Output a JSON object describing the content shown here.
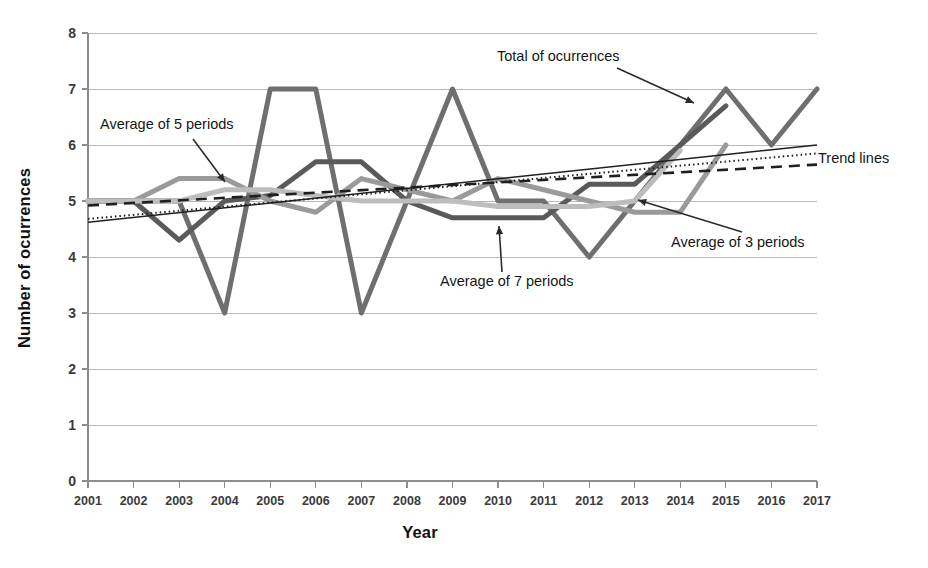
{
  "figure": {
    "background_color": "#ffffff",
    "plot_left_px": 88,
    "plot_right_px": 817,
    "plot_top_px": 33,
    "plot_bottom_px": 481
  },
  "chart_data": {
    "type": "line",
    "title": "",
    "xlabel": "Year",
    "ylabel": "Number of ocurrences",
    "xlim": [
      2001,
      2017
    ],
    "ylim": [
      0,
      8
    ],
    "ytick_step": 1,
    "grid": true,
    "grid_axis": "y",
    "legend": "none (inline annotations with leader lines)",
    "categories": [
      2001,
      2002,
      2003,
      2004,
      2005,
      2006,
      2007,
      2008,
      2009,
      2010,
      2011,
      2012,
      2013,
      2014,
      2015,
      2016,
      2017
    ],
    "xtick_labels": [
      "2001",
      "2002",
      "2003",
      "2004",
      "2005",
      "2006",
      "2007",
      "2008",
      "2009",
      "2010",
      "2011",
      "2012",
      "2013",
      "2014",
      "2015",
      "2016",
      "2017"
    ],
    "ytick_labels": [
      "0",
      "1",
      "2",
      "3",
      "4",
      "5",
      "6",
      "7",
      "8"
    ],
    "series": [
      {
        "name": "Total of ocurrences",
        "key": "total",
        "color": "#6f6f6f",
        "width": 5.0,
        "dash": "none",
        "x": [
          2001,
          2002,
          2003,
          2004,
          2005,
          2006,
          2007,
          2008,
          2009,
          2010,
          2011,
          2012,
          2013,
          2014,
          2015,
          2016,
          2017
        ],
        "values": [
          5,
          5,
          5,
          3,
          7,
          7,
          3,
          5,
          7,
          5,
          5,
          4,
          5,
          6,
          7,
          6,
          7
        ]
      },
      {
        "name": "Average of 3 periods",
        "key": "avg3",
        "color": "#5a5a5a",
        "width": 5.0,
        "dash": "none",
        "x": [
          2001,
          2002,
          2003,
          2004,
          2005,
          2006,
          2007,
          2008,
          2009,
          2010,
          2011,
          2012,
          2013,
          2014,
          2015
        ],
        "values": [
          5.0,
          5.0,
          4.3,
          5.0,
          5.1,
          5.7,
          5.7,
          5.0,
          4.7,
          4.7,
          4.7,
          5.3,
          5.3,
          6.0,
          6.7
        ]
      },
      {
        "name": "Average of 5 periods",
        "key": "avg5",
        "color": "#9a9a9a",
        "width": 5.0,
        "dash": "none",
        "x": [
          2001,
          2002,
          2003,
          2004,
          2005,
          2006,
          2007,
          2008,
          2009,
          2010,
          2011,
          2012,
          2013,
          2014,
          2015
        ],
        "values": [
          5.0,
          5.0,
          5.4,
          5.4,
          5.0,
          4.8,
          5.4,
          5.2,
          5.0,
          5.4,
          5.2,
          5.0,
          4.8,
          4.8,
          6.0
        ]
      },
      {
        "name": "Average of 7 periods",
        "key": "avg7",
        "color": "#bdbdbd",
        "width": 5.0,
        "dash": "none",
        "x": [
          2001,
          2002,
          2003,
          2004,
          2005,
          2006,
          2007,
          2008,
          2009,
          2010,
          2011,
          2012,
          2013,
          2014
        ],
        "values": [
          5.0,
          5.0,
          5.0,
          5.2,
          5.2,
          5.1,
          5.0,
          5.0,
          5.0,
          4.9,
          4.9,
          4.9,
          5.0,
          5.9
        ]
      }
    ],
    "trend_lines": [
      {
        "name": "Trend line - solid",
        "key": "trend_solid",
        "color": "#1f1f1f",
        "width": 1.5,
        "dash": "none",
        "x": [
          2001,
          2017
        ],
        "values": [
          4.62,
          6.0
        ]
      },
      {
        "name": "Trend line - dotted",
        "key": "trend_dotted",
        "color": "#1f1f1f",
        "width": 2.0,
        "dash": "1.5 3",
        "x": [
          2001,
          2017
        ],
        "values": [
          4.68,
          5.85
        ]
      },
      {
        "name": "Trend line - dashed",
        "key": "trend_dashed",
        "color": "#1f1f1f",
        "width": 2.6,
        "dash": "11 7",
        "x": [
          2001,
          2017
        ],
        "values": [
          4.92,
          5.65
        ]
      }
    ],
    "annotations": [
      {
        "key": "total",
        "label": "Total of ocurrences",
        "text_x_px": 497,
        "text_y_px": 61,
        "leader": [
          [
            617,
            68
          ],
          [
            694,
            103
          ]
        ]
      },
      {
        "key": "avg5",
        "label": "Average of 5 periods",
        "text_x_px": 100,
        "text_y_px": 129,
        "leader": [
          [
            193,
            139
          ],
          [
            225,
            182
          ]
        ]
      },
      {
        "key": "avg7",
        "label": "Average of 7 periods",
        "text_x_px": 440,
        "text_y_px": 286,
        "leader": [
          [
            502,
            272
          ],
          [
            499,
            226
          ]
        ]
      },
      {
        "key": "avg3",
        "label": "Average of 3 periods",
        "text_x_px": 671,
        "text_y_px": 247,
        "leader": [
          [
            742,
            232
          ],
          [
            638,
            200
          ]
        ]
      },
      {
        "key": "trend",
        "label": "Trend lines",
        "text_x_px": 818,
        "text_y_px": 163,
        "leader": []
      }
    ]
  }
}
